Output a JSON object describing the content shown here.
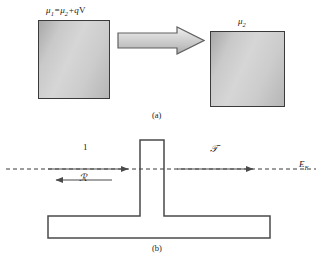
{
  "figure": {
    "panels": [
      {
        "id": "a",
        "caption": "(a)",
        "left_block_label": "μ",
        "left_block_sub": "1",
        "left_block_rest": "=μ",
        "left_block_sub2": "2",
        "left_block_tail": "+q",
        "left_block_tail_upright": "V",
        "right_block_label": "μ",
        "right_block_sub": "2",
        "arrow_name": "transition-arrow"
      },
      {
        "id": "b",
        "caption": "(b)",
        "incident_label": "1",
        "reflected_label": "ℛ",
        "transmitted_label": "𝒯",
        "fermi_label": "E",
        "fermi_sub": "F"
      }
    ]
  },
  "colors": {
    "block_border": "#3a3a3a",
    "block_fill_light": "#d6d6d6",
    "block_fill_dark": "#a8a8a8",
    "arrow_border": "#555555",
    "line": "#4a4a4a",
    "text": "#1a1a1a",
    "background": "#ffffff"
  },
  "geometry": {
    "barrier_left": 140,
    "barrier_right": 164,
    "barrier_top": 10,
    "base_left": 48,
    "base_right": 270,
    "base_top": 86,
    "base_bottom": 108,
    "fermi_line_y": 39
  }
}
